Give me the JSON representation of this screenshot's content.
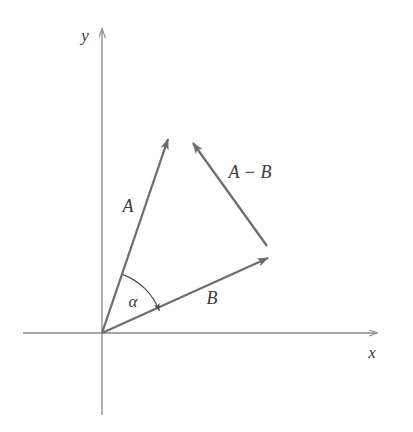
{
  "figure": {
    "background_color": "#ffffff",
    "axis_color": "#8a8a8a",
    "vector_color": "#6e6e6e",
    "arc_color": "#4a4a4a",
    "label_color": "#3a3a3a"
  },
  "axes": {
    "x_label": "x",
    "y_label": "y",
    "origin": {
      "x": 102,
      "y": 333
    },
    "x_axis": {
      "x1": 23,
      "y1": 333,
      "x2": 381,
      "y2": 333
    },
    "y_axis": {
      "x1": 102,
      "y1": 415,
      "x2": 102,
      "y2": 25
    }
  },
  "vectors": [
    {
      "name": "A",
      "label": "A",
      "label_x": 128,
      "label_y": 212,
      "tail": {
        "x": 102,
        "y": 333
      },
      "tip": {
        "x": 172,
        "y": 127
      }
    },
    {
      "name": "B",
      "label": "B",
      "label_x": 212,
      "label_y": 304,
      "tail": {
        "x": 102,
        "y": 333
      },
      "tip": {
        "x": 279,
        "y": 253
      }
    },
    {
      "name": "A-B",
      "label": "A − B",
      "label_x": 250,
      "label_y": 178,
      "tail": {
        "x": 267,
        "y": 246
      },
      "tip": {
        "x": 186,
        "y": 134
      }
    }
  ],
  "angle": {
    "label": "α",
    "label_x": 133,
    "label_y": 307,
    "between": [
      "A",
      "B"
    ],
    "radius": 62
  }
}
